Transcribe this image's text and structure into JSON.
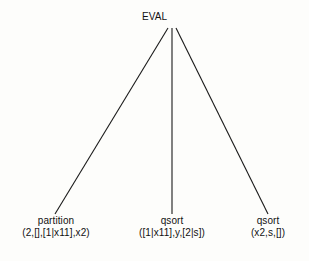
{
  "diagram": {
    "type": "tree",
    "background_color": "#fdfdfb",
    "line_color": "#1a1a1a",
    "text_color": "#111111",
    "root": {
      "label": "EVAL",
      "x": 172,
      "y": 18
    },
    "apex": {
      "x": 172,
      "y": 28
    },
    "leaves": [
      {
        "line1": "partition",
        "line2": "(2,[],[1|x11],x2)",
        "x": 55,
        "y": 215
      },
      {
        "line1": "qsort",
        "line2": "([1|x11],y,[2|s])",
        "x": 172,
        "y": 215
      },
      {
        "line1": "qsort",
        "line2": "(x2,s,[])",
        "x": 268,
        "y": 215
      }
    ],
    "edges": [
      {
        "name": "edge-to-partition",
        "x1": 168,
        "y1": 28,
        "x2": 55,
        "y2": 214
      },
      {
        "name": "edge-to-qsort-left",
        "x1": 172,
        "y1": 28,
        "x2": 172,
        "y2": 214
      },
      {
        "name": "edge-to-qsort-right",
        "x1": 176,
        "y1": 28,
        "x2": 268,
        "y2": 214
      }
    ]
  }
}
